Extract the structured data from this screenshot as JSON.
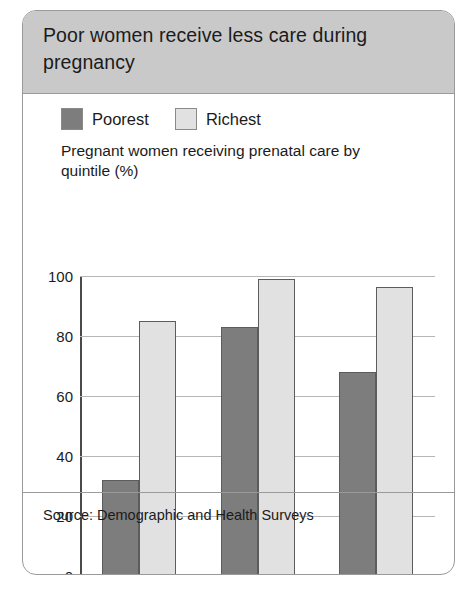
{
  "card": {
    "title": "Poor women receive less care during pregnancy",
    "source": "Source: Demographic and Health Surveys"
  },
  "colors": {
    "poorest": "#7d7d7d",
    "richest": "#e1e1e1",
    "header_bg": "#c9c9c9",
    "border": "#9a9a9a",
    "gridline": "#b6b6b6",
    "axis": "#4a4a4a"
  },
  "chart_data": {
    "type": "bar",
    "title": "Poor women receive less care during pregnancy",
    "subtitle": "Pregnant women receiving prenatal care by quintile (%)",
    "xlabel": "",
    "ylabel": "",
    "ylim": [
      0,
      100
    ],
    "yticks": [
      0,
      20,
      40,
      60,
      80,
      100
    ],
    "ytick_labels": [
      "0",
      "20",
      "40",
      "60",
      "80",
      "100"
    ],
    "grid": true,
    "legend_position": "top-left",
    "categories": [
      "Bangladesh",
      "Indonesia",
      "Liberia"
    ],
    "category_years": [
      "2007",
      "2007",
      "2007"
    ],
    "series": [
      {
        "name": "Poorest",
        "color": "#7d7d7d",
        "values": [
          32,
          83,
          68
        ]
      },
      {
        "name": "Richest",
        "color": "#e1e1e1",
        "values": [
          85,
          99,
          96.5
        ]
      }
    ],
    "source": "Source: Demographic and Health Surveys"
  }
}
